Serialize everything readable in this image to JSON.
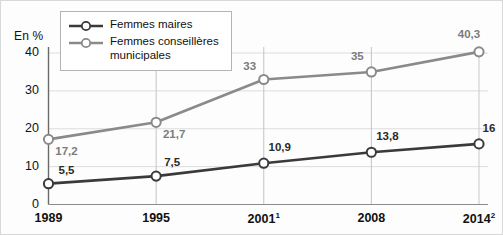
{
  "axis_unit_label": "En %",
  "legend": {
    "items": [
      {
        "label": "Femmes maires",
        "key": "maires",
        "color": "#3a3a3a"
      },
      {
        "label": "Femmes conseillères municipales",
        "key": "conseilleres",
        "color": "#8a8a8a"
      }
    ]
  },
  "chart_data": {
    "type": "line",
    "title": "",
    "xlabel": "",
    "ylabel": "En %",
    "ylim": [
      0,
      43
    ],
    "yticks": [
      0,
      10,
      20,
      30,
      40
    ],
    "ytick_labels": [
      "0",
      "10",
      "20",
      "30",
      "40"
    ],
    "grid": true,
    "legend_position": "top-left",
    "categories": [
      "1989",
      "1995",
      "2001",
      "2008",
      "2014"
    ],
    "category_labels": [
      "1989",
      "1995",
      "2001¹",
      "2008",
      "2014²"
    ],
    "category_notes": [
      "",
      "",
      "1",
      "",
      "2"
    ],
    "series": [
      {
        "name": "Femmes maires",
        "color": "#3a3a3a",
        "values": [
          5.5,
          7.5,
          10.9,
          13.8,
          16
        ],
        "value_labels": [
          "5,5",
          "7,5",
          "10,9",
          "13,8",
          "16"
        ]
      },
      {
        "name": "Femmes conseillères municipales",
        "color": "#8a8a8a",
        "values": [
          17.2,
          21.7,
          33,
          35,
          40.3
        ],
        "value_labels": [
          "17,2",
          "21,7",
          "33",
          "35",
          "40,3"
        ]
      }
    ]
  }
}
